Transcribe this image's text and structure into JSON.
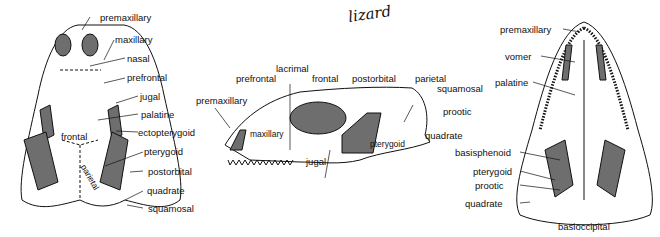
{
  "title_handwritten": "lizard",
  "dorsal_view": {
    "labels": [
      "premaxillary",
      "maxillary",
      "nasal",
      "prefrontal",
      "jugal",
      "palatine",
      "ectopterygoid",
      "pterygoid",
      "postorbital",
      "quadrate",
      "squamosal"
    ],
    "inner_labels": [
      "frontal",
      "parietal"
    ]
  },
  "lateral_view": {
    "labels": [
      "lacrimal",
      "prefrontal",
      "frontal",
      "postorbital",
      "parietal",
      "squamosal",
      "premaxillary",
      "prootic",
      "quadrate",
      "jugal"
    ],
    "inner_labels": [
      "maxillary",
      "pterygoid"
    ]
  },
  "ventral_view": {
    "labels": [
      "premaxillary",
      "vomer",
      "palatine",
      "basisphenoid",
      "pterygoid",
      "prootic",
      "quadrate",
      "basioccipital"
    ]
  },
  "colors": {
    "ink": "#111111",
    "fill_dark": "#6e6e6e",
    "bone": "#ffffff"
  }
}
